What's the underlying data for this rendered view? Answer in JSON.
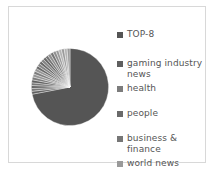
{
  "figure": {
    "background_color": "#ffffff",
    "frame_color": "#d8d8d8",
    "text_color": "#555555"
  },
  "legend": {
    "position": "right",
    "items": [
      {
        "label": "TOP-8",
        "color": "#555555",
        "top": 10
      },
      {
        "label": "gaming industry news",
        "color": "#5f5f5f",
        "top": 39
      },
      {
        "label": "health",
        "color": "#7c7c7c",
        "top": 64
      },
      {
        "label": "people",
        "color": "#6a6a6a",
        "top": 89
      },
      {
        "label": "business & finance",
        "color": "#767676",
        "top": 114
      },
      {
        "label": "world news",
        "color": "#9a9a9a",
        "top": 139
      }
    ]
  },
  "chart_data": {
    "type": "pie",
    "title": "",
    "xlabel": "",
    "ylabel": "",
    "grid": false,
    "legend_position": "right",
    "start_angle": 0,
    "direction": "clockwise",
    "categories": [
      "TOP-8",
      "gaming industry news",
      "health",
      "people",
      "business & finance",
      "world news"
    ],
    "values": [
      72,
      6,
      5,
      6,
      5,
      6
    ],
    "colors": [
      "#555555",
      "#5f5f5f",
      "#7c7c7c",
      "#6a6a6a",
      "#767676",
      "#9a9a9a"
    ],
    "slices": [
      {
        "label": "TOP-8",
        "value": 72,
        "color": "#555555"
      },
      {
        "label": "gaming industry news",
        "value": 6,
        "color": "#5f5f5f"
      },
      {
        "label": "health",
        "value": 5,
        "color": "#7c7c7c"
      },
      {
        "label": "people",
        "value": 6,
        "color": "#6a6a6a"
      },
      {
        "label": "business & finance",
        "value": 5,
        "color": "#767676"
      },
      {
        "label": "world news",
        "value": 6,
        "color": "#9a9a9a"
      }
    ]
  }
}
